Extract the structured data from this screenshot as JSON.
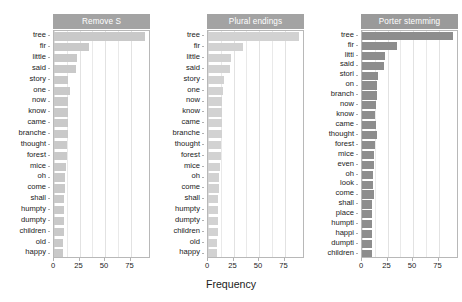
{
  "chart_data": {
    "type": "bar",
    "orientation": "horizontal",
    "title": "",
    "xlabel": "Frequency",
    "ylabel": "",
    "xlim": [
      0,
      95
    ],
    "xticks": [
      0,
      25,
      50,
      75
    ],
    "xticklabels": [
      "0",
      "25",
      "50",
      "75"
    ],
    "grid": true,
    "legend_position": "none",
    "panels": [
      {
        "title": "Remove S",
        "bar_color": "#c9c9c9",
        "categories": [
          "tree",
          "fir",
          "little",
          "said",
          "story",
          "one",
          "now",
          "know",
          "came",
          "branche",
          "thought",
          "forest",
          "mice",
          "oh",
          "come",
          "shall",
          "humpty",
          "dumpty",
          "children",
          "old",
          "happy"
        ],
        "values": [
          89,
          34,
          23,
          22,
          14,
          16,
          14,
          14,
          14,
          14,
          13,
          13,
          12,
          11,
          11,
          10,
          10,
          10,
          10,
          9,
          9
        ]
      },
      {
        "title": "Plural endings",
        "bar_color": "#d2d2d2",
        "categories": [
          "tree",
          "fir",
          "little",
          "said",
          "story",
          "one",
          "now",
          "know",
          "came",
          "branche",
          "thought",
          "forest",
          "mice",
          "oh",
          "come",
          "shall",
          "humpty",
          "dumpty",
          "children",
          "old",
          "happy"
        ],
        "values": [
          89,
          34,
          23,
          22,
          16,
          15,
          14,
          14,
          14,
          14,
          13,
          13,
          12,
          11,
          11,
          10,
          10,
          10,
          10,
          9,
          9
        ]
      },
      {
        "title": "Porter stemming",
        "bar_color": "#8d8d8d",
        "categories": [
          "tree",
          "fir",
          "litti",
          "said",
          "stori",
          "on",
          "branch",
          "now",
          "know",
          "came",
          "thought",
          "forest",
          "mice",
          "even",
          "oh",
          "look",
          "come",
          "shall",
          "place",
          "humpti",
          "happi",
          "dumpti",
          "children"
        ],
        "values": [
          89,
          34,
          23,
          22,
          16,
          15,
          15,
          14,
          13,
          14,
          15,
          13,
          12,
          12,
          11,
          11,
          12,
          10,
          10,
          10,
          10,
          10,
          10
        ]
      }
    ]
  }
}
